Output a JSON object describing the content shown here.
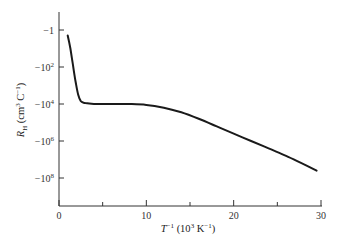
{
  "chart_data": {
    "type": "line",
    "title": "",
    "xlabel": "T^-1 (10^3 K^-1)",
    "ylabel": "R_H (cm^3 C^-1)",
    "x_ticks": [
      0,
      10,
      20,
      30
    ],
    "x_minor_ticks": [
      5,
      15,
      25
    ],
    "xlim": [
      0,
      30
    ],
    "y_scale": "negative-log10",
    "y_ticks": [
      "-1",
      "-10^2",
      "-10^4",
      "-10^6",
      "-10^8"
    ],
    "y_tick_exponents": [
      0,
      2,
      4,
      6,
      8
    ],
    "ylim_exponent": [
      -0.8,
      9.5
    ],
    "grid": false,
    "legend": null,
    "series": [
      {
        "name": "R_H vs 1/T",
        "x": [
          1.0,
          1.3,
          1.6,
          1.9,
          2.2,
          2.5,
          3.0,
          4.0,
          6.0,
          8.0,
          10.0,
          12.0,
          14.0,
          16.0,
          18.0,
          20.0,
          22.0,
          24.0,
          26.0,
          28.0,
          29.5
        ],
        "log10_abs_y": [
          0.3,
          1.0,
          1.9,
          2.8,
          3.5,
          3.85,
          3.95,
          4.0,
          4.0,
          4.0,
          4.05,
          4.2,
          4.45,
          4.8,
          5.2,
          5.6,
          6.0,
          6.4,
          6.8,
          7.25,
          7.6
        ]
      }
    ]
  },
  "axes": {
    "x_tick_labels": [
      "0",
      "10",
      "20",
      "30"
    ],
    "y_tick_labels": [
      {
        "base": "−1",
        "exp": ""
      },
      {
        "base": "−10",
        "exp": "2"
      },
      {
        "base": "−10",
        "exp": "4"
      },
      {
        "base": "−10",
        "exp": "6"
      },
      {
        "base": "−10",
        "exp": "8"
      }
    ],
    "xlabel": {
      "main": "T",
      "sup1": "−1",
      "unit_open": " (10",
      "sup2": "3",
      "unit_mid": " K",
      "sup3": "−1",
      "unit_close": ")"
    },
    "ylabel": {
      "main": "R",
      "sub": "H",
      "unit_open": " (cm",
      "sup1": "3",
      "unit_mid": " C",
      "sup2": "−1",
      "unit_close": ")"
    }
  }
}
